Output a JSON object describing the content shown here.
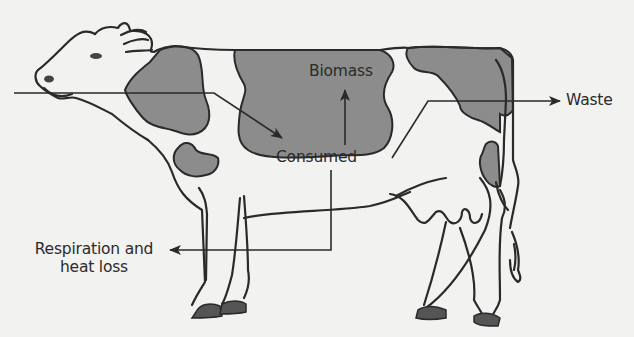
{
  "diagram": {
    "colors": {
      "background": "#f2f2f1",
      "outline": "#2a2a2a",
      "patch": "#8c8c8c",
      "hoof": "#555555",
      "arrow": "#2a2a2a"
    },
    "labels": {
      "biomass": "Biomass",
      "consumed": "Consumed",
      "waste": "Waste",
      "respiration_line1": "Respiration and",
      "respiration_line2": "heat loss"
    },
    "arrows": [
      {
        "from": "input (left)",
        "to": "consumed"
      },
      {
        "from": "consumed",
        "to": "biomass"
      },
      {
        "from": "consumed",
        "to": "waste"
      },
      {
        "from": "consumed",
        "to": "respiration_and_heat_loss"
      }
    ]
  }
}
